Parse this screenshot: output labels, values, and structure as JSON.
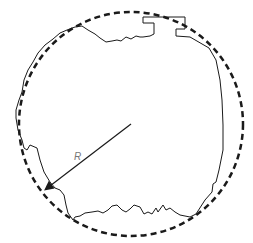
{
  "diagram": {
    "type": "schematic",
    "radius_label": "R",
    "colors": {
      "background": "#ffffff",
      "stroke": "#1a1a1a",
      "label": "#777777"
    },
    "circle": {
      "cx": 131,
      "cy": 124,
      "r": 112,
      "style": "dashed"
    },
    "radius_arrow": {
      "from": [
        131,
        124
      ],
      "to": [
        45,
        190
      ]
    }
  }
}
